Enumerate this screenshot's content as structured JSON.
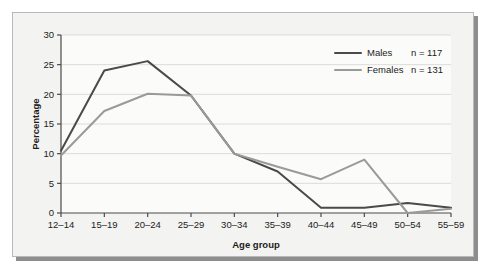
{
  "chart_data": {
    "type": "line",
    "title": "",
    "xlabel": "Age group",
    "ylabel": "Percentage",
    "categories": [
      "12–14",
      "15–19",
      "20–24",
      "25–29",
      "30–34",
      "35–39",
      "40–44",
      "45–49",
      "50–54",
      "55–59"
    ],
    "series": [
      {
        "name": "Males",
        "annotation": "n = 117",
        "color": "#4a4a4a",
        "values": [
          10.5,
          24.0,
          25.6,
          19.8,
          10.0,
          7.0,
          0.9,
          0.9,
          1.7,
          0.9
        ]
      },
      {
        "name": "Females",
        "annotation": "n = 131",
        "color": "#9a9a9a",
        "values": [
          9.7,
          17.2,
          20.1,
          19.8,
          10.0,
          7.8,
          5.7,
          9.0,
          0.0,
          0.7
        ]
      }
    ],
    "ylim": [
      0,
      30
    ],
    "yticks": [
      0,
      5,
      10,
      15,
      20,
      25,
      30
    ],
    "ytick_labels": [
      "0",
      "5",
      "10",
      "15",
      "20",
      "25",
      "30"
    ],
    "grid": true,
    "legend_position": "top-right"
  },
  "legend": {
    "entries": [
      {
        "label": "Males",
        "count": "n = 117"
      },
      {
        "label": "Females",
        "count": "n = 131"
      }
    ]
  },
  "colors": {
    "males": "#4a4a4a",
    "females": "#9a9a9a",
    "panel_background": "#f3f3f1",
    "plot_background": "#fbfbfa",
    "gridline": "#d8d8d6",
    "axis": "#4a4a4a",
    "panel_border": "#b9b9b7",
    "shadow": "#8d8d8d"
  }
}
